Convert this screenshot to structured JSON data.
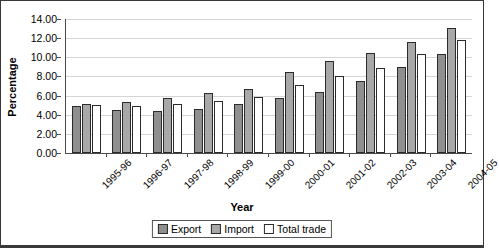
{
  "chart_data": {
    "type": "bar",
    "title": "",
    "xlabel": "Year",
    "ylabel": "Percentage",
    "ylim": [
      0,
      14
    ],
    "ytick_step": 2,
    "ytick_labels": [
      "0.00",
      "2.00",
      "4.00",
      "6.00",
      "8.00",
      "10.00",
      "12.00",
      "14.00"
    ],
    "grid": true,
    "legend_position": "bottom",
    "categories": [
      "1995-96",
      "1996-97",
      "1997-98",
      "1998-99",
      "1999-00",
      "2000-01",
      "2001-02",
      "2002-03",
      "2003-04",
      "2004-05"
    ],
    "series": [
      {
        "name": "Export",
        "color": "#8f8f8f",
        "values": [
          4.9,
          4.5,
          4.4,
          4.6,
          5.1,
          5.8,
          6.4,
          7.5,
          9.0,
          10.3
        ]
      },
      {
        "name": "Import",
        "color": "#a8a8a8",
        "values": [
          5.1,
          5.3,
          5.8,
          6.3,
          6.7,
          8.5,
          9.6,
          10.4,
          11.6,
          13.1
        ]
      },
      {
        "name": "Total trade",
        "color": "#ffffff",
        "values": [
          5.0,
          4.95,
          5.1,
          5.45,
          5.9,
          7.1,
          8.0,
          8.9,
          10.3,
          11.8
        ]
      }
    ]
  }
}
